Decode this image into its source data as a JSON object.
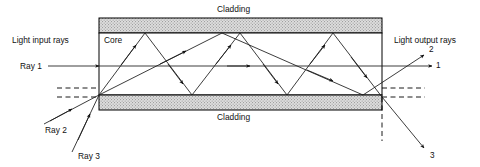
{
  "figure": {
    "type": "optical-fiber-ray-diagram",
    "labels": {
      "cladding_top": "Cladding",
      "cladding_bottom": "Cladding",
      "core": "Core",
      "input_rays": "Light input rays",
      "output_rays": "Light output rays",
      "ray1": "Ray 1",
      "ray2": "Ray 2",
      "ray3": "Ray 3",
      "out1": "1",
      "out2": "2",
      "out3": "3"
    },
    "colors": {
      "stroke": "#000000",
      "cladding_fill": "#d8d8d8",
      "core_fill": "#ffffff",
      "background": "#ffffff",
      "ray": "#1a1a1a",
      "dashed": "#000000"
    },
    "geometry": {
      "fiber_left": 99,
      "fiber_right": 382,
      "cladding_top_y": 18,
      "core_top_y": 33,
      "core_bottom_y": 95,
      "cladding_bottom_y": 110,
      "axis_y": 66,
      "dashed_upper_y": 88,
      "dashed_lower_y": 97
    },
    "rays": {
      "ray1": {
        "description": "Axial ray travelling straight along fiber axis, exits as output 1",
        "path": "straight"
      },
      "ray2": {
        "description": "Low-angle meridional ray, few total internal reflections, exits as output 2",
        "top_vertices": [
          222
        ],
        "bottom_vertices": [
          363
        ]
      },
      "ray3": {
        "description": "High-angle meridional ray, many total internal reflections, refracts out as output 3",
        "top_vertices": [
          145,
          240,
          333
        ],
        "bottom_vertices": [
          192,
          287,
          363
        ]
      }
    }
  }
}
